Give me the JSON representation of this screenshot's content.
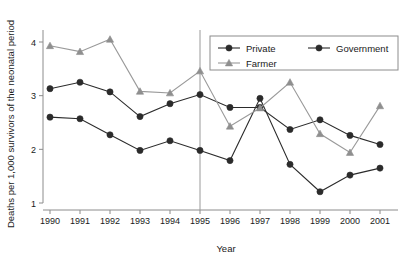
{
  "chart_data": {
    "type": "line",
    "title": "",
    "xlabel": "Year",
    "ylabel": "Deaths per 1,000 survivors of the neonatal period",
    "categories": [
      "1990",
      "1991",
      "1992",
      "1993",
      "1994",
      "1995",
      "1996",
      "1997",
      "1998",
      "1999",
      "2000",
      "2001"
    ],
    "x": [
      1990,
      1991,
      1992,
      1993,
      1994,
      1995,
      1996,
      1997,
      1998,
      1999,
      2000,
      2001
    ],
    "xlim": [
      1990,
      2001
    ],
    "ylim": [
      0.8,
      4.25
    ],
    "yticks": [
      1,
      2,
      3,
      4
    ],
    "ytick_labels": [
      "1",
      "2",
      "3",
      "4"
    ],
    "grid": false,
    "legend_position": "top-right",
    "annotations": [
      {
        "type": "vline",
        "x": 1995,
        "label": ""
      }
    ],
    "series": [
      {
        "name": "Private",
        "marker": "circle",
        "color": "#2b2b2b",
        "values": [
          3.13,
          3.25,
          3.07,
          2.61,
          2.85,
          3.02,
          2.78,
          2.78,
          2.37,
          2.55,
          2.26,
          2.09
        ]
      },
      {
        "name": "Government",
        "marker": "circle",
        "color": "#2b2b2b",
        "values": [
          2.6,
          2.57,
          2.27,
          1.98,
          2.16,
          1.98,
          1.79,
          2.95,
          1.72,
          1.21,
          1.52,
          1.65
        ]
      },
      {
        "name": "Farmer",
        "marker": "triangle",
        "color": "#8f8f8f",
        "values": [
          3.93,
          3.82,
          4.05,
          3.08,
          3.05,
          3.46,
          2.43,
          2.77,
          3.25,
          2.29,
          1.94,
          2.81
        ]
      }
    ]
  },
  "legend": {
    "entries": [
      {
        "label": "Private",
        "marker": "circle-dark"
      },
      {
        "label": "Government",
        "marker": "circle-dark"
      },
      {
        "label": "Farmer",
        "marker": "triangle-gray"
      }
    ]
  },
  "axes": {
    "x_title": "Year",
    "y_title": "Deaths per 1,000 survivors of the neonatal period",
    "y_tick_labels": [
      "4",
      "3",
      "2",
      "1"
    ],
    "x_tick_labels": [
      "1990",
      "1991",
      "1992",
      "1993",
      "1994",
      "1995",
      "1996",
      "1997",
      "1998",
      "1999",
      "2000",
      "2001"
    ]
  }
}
